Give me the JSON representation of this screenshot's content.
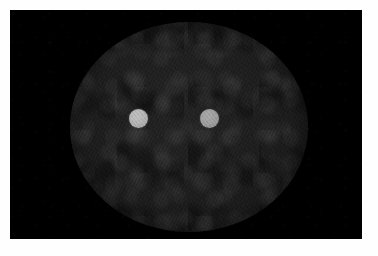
{
  "viewer": {
    "background_color": "#fefefe",
    "field_color": "#000000"
  },
  "scan": {
    "modality_label": "phantom-scan",
    "field": {
      "x": 10,
      "y": 10,
      "width": 352,
      "height": 229,
      "color": "#000000"
    },
    "phantom": {
      "shape": "circle",
      "center_x": 189,
      "center_y": 127,
      "radius_x": 119,
      "radius_y": 105,
      "fill_color": "#1e1e1e",
      "texture": "mottled-noise"
    },
    "inserts": [
      {
        "id": "insert-left",
        "shape": "circle",
        "center_x": 138,
        "center_y": 118,
        "diameter": 19,
        "fill_color": "#b6b6b6",
        "intensity": "bright"
      },
      {
        "id": "insert-right",
        "shape": "circle",
        "center_x": 209,
        "center_y": 118,
        "diameter": 19,
        "fill_color": "#a0a0a0",
        "intensity": "bright"
      }
    ]
  }
}
